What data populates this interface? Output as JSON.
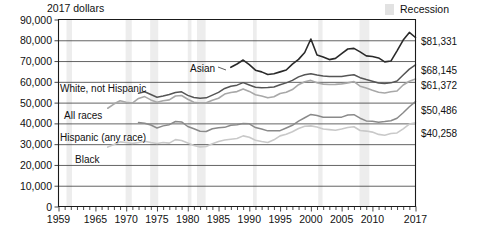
{
  "header": {
    "unit_note": "2017 dollars",
    "legend": {
      "recession_label": "Recession",
      "recession_color": "#ededed"
    }
  },
  "axes": {
    "y_ticks": [
      "90,000",
      "80,000",
      "70,000",
      "60,000",
      "50,000",
      "40,000",
      "30,000",
      "20,000",
      "10,000",
      "0"
    ],
    "x_ticks": [
      "1959",
      "1965",
      "1970",
      "1975",
      "1980",
      "1985",
      "1990",
      "1995",
      "2000",
      "2005",
      "2010",
      "2017"
    ]
  },
  "series_labels": {
    "asian": "Asian",
    "white_not_hispanic": "White, not Hispanic",
    "all_races": "All races",
    "hispanic": "Hispanic (any race)",
    "black": "Black"
  },
  "end_labels": {
    "asian": "$81,331",
    "white_not_hispanic": "$68,145",
    "all_races": "$61,372",
    "hispanic": "$50,486",
    "black": "$40,258"
  },
  "chart_data": {
    "type": "line",
    "title": "",
    "subtitle": "",
    "xlabel": "",
    "ylabel": "2017 dollars",
    "xlim": [
      1959,
      2017
    ],
    "ylim": [
      0,
      90000
    ],
    "y_tick_values": [
      0,
      10000,
      20000,
      30000,
      40000,
      50000,
      60000,
      70000,
      80000,
      90000
    ],
    "x_tick_values": [
      1959,
      1965,
      1970,
      1975,
      1980,
      1985,
      1990,
      1995,
      2000,
      2005,
      2010,
      2017
    ],
    "grid": "horizontal",
    "legend_position": "inline-labels",
    "recessions": [
      [
        1960.3,
        1961.2
      ],
      [
        1969.9,
        1970.9
      ],
      [
        1973.9,
        1975.2
      ],
      [
        1980.0,
        1980.6
      ],
      [
        1981.5,
        1982.9
      ],
      [
        1990.6,
        1991.2
      ],
      [
        2001.2,
        2001.9
      ],
      [
        2007.9,
        2009.5
      ]
    ],
    "series": [
      {
        "name": "Asian",
        "color": "#2a2a2a",
        "width": 1.6,
        "x": [
          1987,
          1988,
          1989,
          1990,
          1991,
          1992,
          1993,
          1994,
          1995,
          1996,
          1997,
          1998,
          1999,
          2000,
          2001,
          2002,
          2003,
          2004,
          2005,
          2006,
          2007,
          2008,
          2009,
          2010,
          2011,
          2012,
          2013,
          2014,
          2015,
          2016,
          2017
        ],
        "values": [
          67000,
          68600,
          70500,
          68300,
          65600,
          64800,
          63500,
          63900,
          64800,
          65700,
          68500,
          70800,
          74100,
          80600,
          72900,
          72000,
          70700,
          71300,
          73600,
          75800,
          76100,
          74400,
          72500,
          72200,
          71500,
          69600,
          70000,
          74900,
          80100,
          83800,
          81331
        ]
      },
      {
        "name": "White, not Hispanic",
        "color": "#555555",
        "width": 1.5,
        "x": [
          1972,
          1973,
          1974,
          1975,
          1976,
          1977,
          1978,
          1979,
          1980,
          1981,
          1982,
          1983,
          1984,
          1985,
          1986,
          1987,
          1988,
          1989,
          1990,
          1991,
          1992,
          1993,
          1994,
          1995,
          1996,
          1997,
          1998,
          1999,
          2000,
          2001,
          2002,
          2003,
          2004,
          2005,
          2006,
          2007,
          2008,
          2009,
          2010,
          2011,
          2012,
          2013,
          2014,
          2015,
          2016,
          2017
        ],
        "values": [
          54500,
          55200,
          53900,
          52600,
          53200,
          53900,
          54900,
          55200,
          53500,
          52500,
          52100,
          52300,
          53600,
          54900,
          56800,
          57900,
          58400,
          59600,
          58500,
          57400,
          57200,
          57300,
          57500,
          58600,
          59500,
          60700,
          62400,
          63400,
          63900,
          63300,
          62800,
          62600,
          62600,
          62600,
          63000,
          63400,
          62000,
          61100,
          60300,
          59400,
          59200,
          59500,
          60400,
          63300,
          66100,
          68145
        ]
      },
      {
        "name": "All races",
        "color": "#a8a8a8",
        "width": 1.6,
        "x": [
          1967,
          1968,
          1969,
          1970,
          1971,
          1972,
          1973,
          1974,
          1975,
          1976,
          1977,
          1978,
          1979,
          1980,
          1981,
          1982,
          1983,
          1984,
          1985,
          1986,
          1987,
          1988,
          1989,
          1990,
          1991,
          1992,
          1993,
          1994,
          1995,
          1996,
          1997,
          1998,
          1999,
          2000,
          2001,
          2002,
          2003,
          2004,
          2005,
          2006,
          2007,
          2008,
          2009,
          2010,
          2011,
          2012,
          2013,
          2014,
          2015,
          2016,
          2017
        ],
        "values": [
          47300,
          49300,
          50900,
          50200,
          49800,
          52000,
          52900,
          51300,
          50200,
          50900,
          51300,
          53200,
          53400,
          51600,
          50200,
          49800,
          49900,
          51100,
          52100,
          54100,
          54900,
          55300,
          56600,
          55400,
          53800,
          53200,
          52300,
          52800,
          54400,
          55000,
          56300,
          58600,
          60000,
          60700,
          59600,
          58900,
          58700,
          58800,
          59000,
          59500,
          60100,
          57900,
          57000,
          55900,
          55000,
          54600,
          55200,
          55600,
          58500,
          60300,
          61372
        ]
      },
      {
        "name": "Hispanic (any race)",
        "color": "#8a8a8a",
        "width": 1.5,
        "x": [
          1972,
          1973,
          1974,
          1975,
          1976,
          1977,
          1978,
          1979,
          1980,
          1981,
          1982,
          1983,
          1984,
          1985,
          1986,
          1987,
          1988,
          1989,
          1990,
          1991,
          1992,
          1993,
          1994,
          1995,
          1996,
          1997,
          1998,
          1999,
          2000,
          2001,
          2002,
          2003,
          2004,
          2005,
          2006,
          2007,
          2008,
          2009,
          2010,
          2011,
          2012,
          2013,
          2014,
          2015,
          2016,
          2017
        ],
        "values": [
          40400,
          40100,
          39200,
          37800,
          38800,
          39400,
          40900,
          40700,
          38500,
          37400,
          36200,
          36100,
          37400,
          37900,
          38100,
          39100,
          39400,
          40000,
          39800,
          38000,
          37300,
          36400,
          36400,
          36500,
          37800,
          39100,
          41100,
          42700,
          44300,
          43800,
          43000,
          42900,
          43000,
          43000,
          44000,
          44200,
          42500,
          41200,
          41000,
          40600,
          40900,
          41300,
          42500,
          45100,
          48000,
          50486
        ]
      },
      {
        "name": "Black",
        "color": "#c9c9c9",
        "width": 1.6,
        "x": [
          1967,
          1968,
          1969,
          1970,
          1971,
          1972,
          1973,
          1974,
          1975,
          1976,
          1977,
          1978,
          1979,
          1980,
          1981,
          1982,
          1983,
          1984,
          1985,
          1986,
          1987,
          1988,
          1989,
          1990,
          1991,
          1992,
          1993,
          1994,
          1995,
          1996,
          1997,
          1998,
          1999,
          2000,
          2001,
          2002,
          2003,
          2004,
          2005,
          2006,
          2007,
          2008,
          2009,
          2010,
          2011,
          2012,
          2013,
          2014,
          2015,
          2016,
          2017
        ],
        "values": [
          28600,
          29800,
          31100,
          30800,
          30400,
          30800,
          31400,
          30800,
          30300,
          30800,
          30500,
          32200,
          31800,
          30600,
          29400,
          28700,
          28900,
          30200,
          31300,
          32000,
          32400,
          32700,
          34000,
          33300,
          31900,
          31300,
          30800,
          32100,
          34000,
          34800,
          36000,
          37500,
          38600,
          38800,
          38300,
          37300,
          37000,
          36700,
          37300,
          38000,
          38400,
          36600,
          36300,
          35800,
          34700,
          34300,
          35100,
          35400,
          37400,
          39700,
          40258
        ]
      }
    ]
  }
}
